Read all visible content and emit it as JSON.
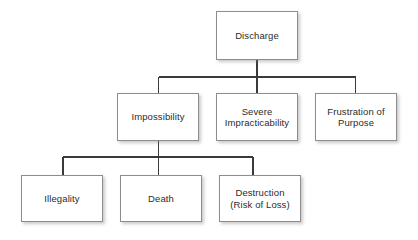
{
  "diagram": {
    "type": "hierarchy-tree",
    "title": "Discharge",
    "background_color": "#ffffff",
    "box_fill_color": "#ffffff",
    "box_border_color": "#8d8d8d",
    "text_color": "#2b2b2b",
    "connector_color": "#3a3a3a",
    "nodes": [
      {
        "id": "discharge",
        "label": "Discharge",
        "level": 1,
        "x": 216,
        "y": 11,
        "w": 82,
        "h": 49
      },
      {
        "id": "impossibility",
        "label": "Impossibility",
        "level": 2,
        "x": 117,
        "y": 93,
        "w": 82,
        "h": 48
      },
      {
        "id": "severe-impracticability",
        "label": "Severe\nImpracticability",
        "level": 2,
        "x": 216,
        "y": 93,
        "w": 82,
        "h": 48
      },
      {
        "id": "frustration-of-purpose",
        "label": "Frustration of\nPurpose",
        "level": 2,
        "x": 315,
        "y": 93,
        "w": 82,
        "h": 48
      },
      {
        "id": "illegality",
        "label": "Illegality",
        "level": 3,
        "x": 21,
        "y": 175,
        "w": 82,
        "h": 47
      },
      {
        "id": "death",
        "label": "Death",
        "level": 3,
        "x": 120,
        "y": 175,
        "w": 82,
        "h": 47
      },
      {
        "id": "destruction",
        "label": "Destruction\n(Risk of Loss)",
        "level": 3,
        "x": 219,
        "y": 175,
        "w": 82,
        "h": 47
      }
    ],
    "edges": [
      {
        "from": "discharge",
        "to": "impossibility"
      },
      {
        "from": "discharge",
        "to": "severe-impracticability"
      },
      {
        "from": "discharge",
        "to": "frustration-of-purpose"
      },
      {
        "from": "impossibility",
        "to": "illegality"
      },
      {
        "from": "impossibility",
        "to": "death"
      },
      {
        "from": "impossibility",
        "to": "destruction"
      }
    ]
  }
}
